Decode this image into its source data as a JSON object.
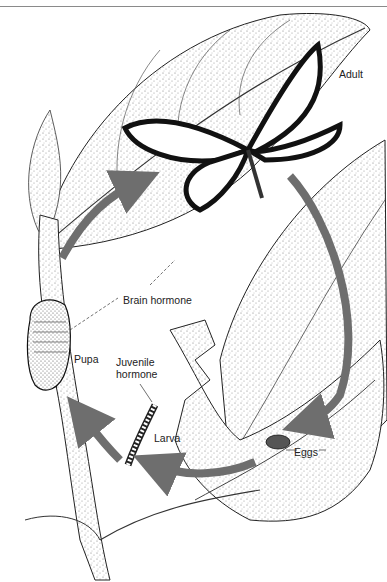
{
  "diagram": {
    "colors": {
      "arrow": "#6e6e6e",
      "ink": "#111111",
      "stipple": "#9a9a9a",
      "background": "#ffffff"
    },
    "labels": {
      "adult": "Adult",
      "brain_hormone": "Brain hormone",
      "pupa": "Pupa",
      "juvenile_hormone_line1": "Juvenile",
      "juvenile_hormone_line2": "hormone",
      "larva": "Larva",
      "eggs": "Eggs"
    },
    "stages": [
      "Eggs",
      "Larva",
      "Pupa",
      "Adult"
    ],
    "cycle_arrows": [
      {
        "from": "Adult",
        "to": "Eggs"
      },
      {
        "from": "Eggs",
        "to": "Larva"
      },
      {
        "from": "Larva",
        "to": "Pupa"
      },
      {
        "from": "Pupa",
        "to": "Adult"
      }
    ]
  }
}
